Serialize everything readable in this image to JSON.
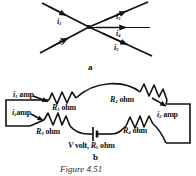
{
  "figure": {
    "caption": "Figure 4.51",
    "panels": [
      {
        "id": "a",
        "label": "a"
      },
      {
        "id": "b",
        "label": "b"
      }
    ]
  },
  "junction_diagram": {
    "panel_label": "a",
    "branches": [
      {
        "name": "i1",
        "symbol": "i",
        "subscript": "1",
        "position": "upper-left",
        "direction": "into-junction"
      },
      {
        "name": "i2",
        "symbol": "i",
        "subscript": "2",
        "position": "lower-left",
        "direction": "into-junction"
      },
      {
        "name": "i3",
        "symbol": "i",
        "subscript": "3",
        "position": "upper-right",
        "direction": "out-of-junction"
      },
      {
        "name": "i4",
        "symbol": "i",
        "subscript": "4",
        "position": "middle-right",
        "direction": "out-of-junction"
      },
      {
        "name": "i5",
        "symbol": "i",
        "subscript": "5",
        "position": "lower-right",
        "direction": "out-of-junction"
      }
    ]
  },
  "circuit_diagram": {
    "panel_label": "b",
    "currents": [
      {
        "name": "i1",
        "symbol": "i",
        "subscript": "1",
        "unit": "amp",
        "branch": "upper-left"
      },
      {
        "name": "i2",
        "symbol": "i",
        "subscript": "2",
        "unit": "amp",
        "branch": "lower-left"
      },
      {
        "name": "i2_right",
        "symbol": "i",
        "subscript": "2",
        "unit": "amp",
        "branch": "right"
      }
    ],
    "resistors": [
      {
        "name": "R1",
        "symbol": "R",
        "subscript": "1",
        "unit": "ohm",
        "branch": "upper-left"
      },
      {
        "name": "R2",
        "symbol": "R",
        "subscript": "2",
        "unit": "ohm",
        "branch": "upper-right"
      },
      {
        "name": "R3",
        "symbol": "R",
        "subscript": "3",
        "unit": "ohm",
        "branch": "lower-left"
      },
      {
        "name": "R4",
        "symbol": "R",
        "subscript": "4",
        "unit": "ohm",
        "branch": "lower-right"
      }
    ],
    "source": {
      "name": "battery",
      "voltage_symbol": "V",
      "voltage_unit": "volt",
      "internal_resistance_symbol": "R",
      "internal_resistance_subscript": "5",
      "internal_resistance_unit": "ohm",
      "full_label": "V volt, R5 ohm"
    }
  },
  "colors": {
    "ink": "#1a1a1a",
    "background": "#ffffff"
  }
}
